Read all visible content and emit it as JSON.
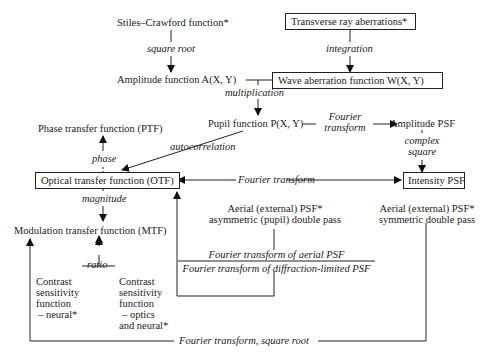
{
  "nodes": {
    "stiles_crawford": "Stiles–Crawford function*",
    "transverse_ray": "Transverse ray aberrations*",
    "amplitude_function": "Amplitude function A(X, Y)",
    "wave_aberration": "Wave aberration function W(X, Y)",
    "pupil_function": "Pupil function P(X, Y)",
    "amplitude_psf": "Amplitude PSF",
    "ptf": "Phase transfer function (PTF)",
    "otf": "Optical transfer function (OTF)",
    "intensity_psf": "Intensity PSF",
    "mtf": "Modulation transfer function (MTF)",
    "aerial_asym_1": "Aerial (external) PSF*",
    "aerial_asym_2": "asymmetric (pupil) double pass",
    "aerial_sym_1": "Aerial (external) PSF*",
    "aerial_sym_2": "symmetric double pass",
    "csf_neural": [
      "Contrast",
      "sensitivity",
      "function",
      "– neural*"
    ],
    "csf_optics": [
      "Contrast",
      "sensitivity",
      "function",
      "– optics",
      "and neural*"
    ]
  },
  "edges": {
    "square_root": "square root",
    "integration": "integration",
    "multiplication": "multiplication",
    "fourier_1": "Fourier",
    "fourier_2": "transform",
    "complex_1": "complex",
    "complex_2": "square",
    "autocorrelation": "autocorrelation",
    "phase": "phase",
    "magnitude": "magnitude",
    "fourier_transform": "Fourier transform",
    "ratio": "ratio",
    "fraction_num": "Fourier transform of aerial PSF",
    "fraction_den": "Fourier transform of diffraction-limited PSF",
    "fourier_sqrt": "Fourier transform, square root"
  }
}
